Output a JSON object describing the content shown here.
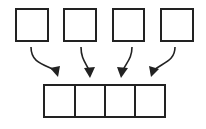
{
  "diagram": {
    "stroke_color": "#222222",
    "background": "#ffffff",
    "source_boxes": [
      {
        "id": "box-1",
        "x": 16,
        "y": 9,
        "w": 32,
        "h": 32
      },
      {
        "id": "box-2",
        "x": 64,
        "y": 9,
        "w": 32,
        "h": 32
      },
      {
        "id": "box-3",
        "x": 113,
        "y": 9,
        "w": 31,
        "h": 32
      },
      {
        "id": "box-4",
        "x": 161,
        "y": 9,
        "w": 32,
        "h": 32
      }
    ],
    "target_array": {
      "x": 44,
      "y": 85,
      "w": 121,
      "h": 32,
      "cells": 4,
      "dividers_x": [
        75,
        105,
        135
      ]
    },
    "arrows": [
      {
        "from": "box-1",
        "to_cell": 0,
        "path": "M31 47 C 31 62, 42 64, 53 68",
        "tip": [
          57,
          76
        ]
      },
      {
        "from": "box-2",
        "to_cell": 1,
        "path": "M81 47 C 81 58, 84 62, 88 68",
        "tip": [
          90,
          77
        ]
      },
      {
        "from": "box-3",
        "to_cell": 2,
        "path": "M132 47 C 132 58, 128 62, 124 68",
        "tip": [
          121,
          77
        ]
      },
      {
        "from": "box-4",
        "to_cell": 3,
        "path": "M175 47 C 175 60, 166 62, 157 68",
        "tip": [
          151,
          76
        ]
      }
    ]
  }
}
